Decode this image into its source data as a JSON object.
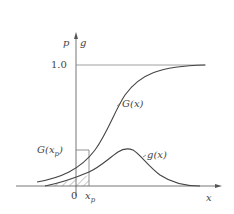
{
  "diagram": {
    "type": "cumulative-distribution-vs-density",
    "axes": {
      "y_axis_labels": [
        "p",
        "g"
      ],
      "x_axis_label": "x",
      "y_tick_label": "1.0",
      "x_tick_labels": [
        "0",
        "x_p"
      ]
    },
    "curves": [
      {
        "name": "G(x)",
        "label": "G(x)",
        "kind": "cumulative distribution (S-curve rising to 1.0)"
      },
      {
        "name": "g(x)",
        "label": "g(x)",
        "kind": "probability density (bell-shaped)"
      }
    ],
    "annotations": {
      "gxp_label": "G(x_p)",
      "shaded_region": "area under g(x) from left tail to x_p (hatched)"
    },
    "colors": {
      "line": "#555555",
      "background": "#ffffff"
    }
  },
  "labels": {
    "p": "p",
    "g": "g",
    "one": "1.0",
    "Gx": "G(x)",
    "gx": "g(x)",
    "Gxp_G": "G(x",
    "Gxp_sub": "p",
    "Gxp_close": ")",
    "zero": "0",
    "xp_x": "x",
    "xp_sub": "p",
    "x": "x"
  }
}
